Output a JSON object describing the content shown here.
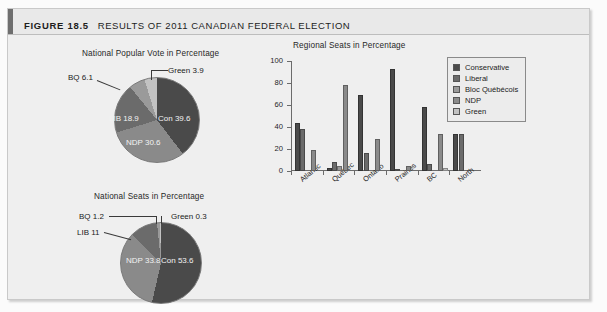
{
  "header": {
    "figure_number": "FIGURE 18.5",
    "title": "RESULTS OF 2011 CANADIAN FEDERAL ELECTION"
  },
  "colors": {
    "conservative": "#4a4a4a",
    "liberal": "#6b6b6b",
    "bloc": "#9a9a9a",
    "ndp": "#8a8a8a",
    "green": "#c2c2c2",
    "panel_bg": "#efefef",
    "header_bg": "#e9e9e9"
  },
  "chart_data": [
    {
      "type": "pie",
      "title": "National Popular Vote in Percentage",
      "categories": [
        "Con",
        "NDP",
        "LIB",
        "BQ",
        "Green"
      ],
      "values": [
        39.6,
        30.6,
        18.9,
        6.1,
        3.9
      ],
      "labels": [
        "Con 39.6",
        "NDP 30.6",
        "LIB 18.9",
        "BQ 6.1",
        "Green 3.9"
      ],
      "unit": "percent"
    },
    {
      "type": "pie",
      "title": "National Seats in Percentage",
      "categories": [
        "Con",
        "NDP",
        "LIB",
        "BQ",
        "Green"
      ],
      "values": [
        53.6,
        33.8,
        11.0,
        1.2,
        0.3
      ],
      "labels": [
        "Con 53.6",
        "NDP 33.8",
        "LIB 11",
        "BQ 1.2",
        "Green 0.3"
      ],
      "unit": "percent"
    },
    {
      "type": "bar",
      "title": "Regional Seats in Percentage",
      "categories": [
        "Atlantic",
        "Québec",
        "Ontario",
        "Prairies",
        "BC",
        "North"
      ],
      "series": [
        {
          "name": "Conservative",
          "values": [
            44,
            3,
            69,
            93,
            58,
            34
          ]
        },
        {
          "name": "Liberal",
          "values": [
            38,
            8,
            16,
            2,
            6,
            34
          ]
        },
        {
          "name": "Bloc Québécois",
          "values": [
            0,
            5,
            0,
            0,
            0,
            0
          ]
        },
        {
          "name": "NDP",
          "values": [
            19,
            78,
            29,
            5,
            34,
            0
          ]
        },
        {
          "name": "Green",
          "values": [
            0,
            0,
            0,
            0,
            3,
            0
          ]
        }
      ],
      "xlabel": "",
      "ylabel": "",
      "ylim": [
        0,
        100
      ],
      "yticks": [
        0,
        20,
        40,
        60,
        80,
        100
      ],
      "grid": false,
      "legend_position": "top-right",
      "legend": [
        "Conservative",
        "Liberal",
        "Bloc Québécois",
        "NDP",
        "Green"
      ]
    }
  ]
}
